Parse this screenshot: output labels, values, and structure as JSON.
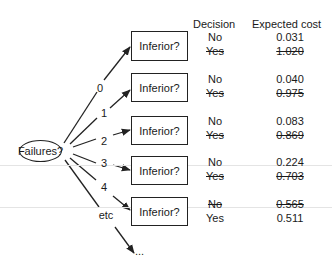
{
  "root_node": {
    "label": "Failures?"
  },
  "headers": {
    "decision": "Decision",
    "expected_cost": "Expected cost"
  },
  "branches": [
    {
      "label": "0",
      "node": "Inferior?",
      "no": {
        "decision": "No",
        "cost": "0.031",
        "struck": false
      },
      "yes": {
        "decision": "Yes",
        "cost": "1.020",
        "struck": true
      }
    },
    {
      "label": "1",
      "node": "Inferior?",
      "no": {
        "decision": "No",
        "cost": "0.040",
        "struck": false
      },
      "yes": {
        "decision": "Yes",
        "cost": "0.975",
        "struck": true
      }
    },
    {
      "label": "2",
      "node": "Inferior?",
      "no": {
        "decision": "No",
        "cost": "0.083",
        "struck": false
      },
      "yes": {
        "decision": "Yes",
        "cost": "0.869",
        "struck": true
      }
    },
    {
      "label": "3",
      "node": "Inferior?",
      "no": {
        "decision": "No",
        "cost": "0.224",
        "struck": false
      },
      "yes": {
        "decision": "Yes",
        "cost": "0.703",
        "struck": true
      }
    },
    {
      "label": "4",
      "node": "Inferior?",
      "no": {
        "decision": "No",
        "cost": "0.565",
        "struck": true
      },
      "yes": {
        "decision": "Yes",
        "cost": "0.511",
        "struck": false
      }
    }
  ],
  "etc_branch": {
    "label": "etc",
    "terminal": "..."
  },
  "colors": {
    "line": "#222222",
    "text": "#1a1a1a",
    "background": "#ffffff"
  }
}
